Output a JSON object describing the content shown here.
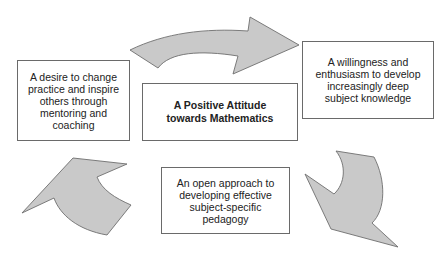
{
  "diagram": {
    "center": {
      "line1": "A Positive Attitude",
      "line2": "towards Mathematics"
    },
    "nodes": [
      {
        "id": "subject-knowledge",
        "lines": [
          "A willingness and",
          "enthusiasm to develop",
          "increasingly deep",
          "subject knowledge"
        ]
      },
      {
        "id": "pedagogy",
        "lines": [
          "An open approach to",
          "developing effective",
          "subject-specific",
          "pedagogy"
        ]
      },
      {
        "id": "mentoring",
        "lines": [
          "A desire to change",
          "practice and inspire",
          "others through",
          "mentoring and",
          "coaching"
        ]
      }
    ],
    "arrows": [
      {
        "name": "top-arrow",
        "from": "mentoring",
        "to": "subject-knowledge",
        "direction": "right"
      },
      {
        "name": "right-arrow",
        "from": "subject-knowledge",
        "to": "pedagogy",
        "direction": "down"
      },
      {
        "name": "left-arrow",
        "from": "pedagogy",
        "to": "mentoring",
        "direction": "up"
      }
    ],
    "colors": {
      "arrow_fill": "#c9c9c9",
      "arrow_stroke": "#6e6e6e",
      "box_border": "#6a6a6a",
      "text": "#222222"
    }
  }
}
